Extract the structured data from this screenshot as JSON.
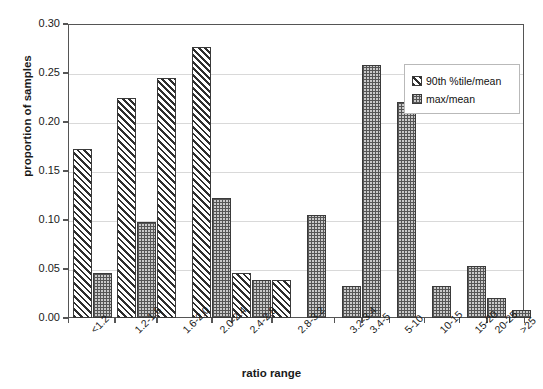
{
  "chart_data": {
    "type": "bar",
    "title": "",
    "xlabel": "ratio range",
    "ylabel": "proportion of samples",
    "ylim": [
      0.0,
      0.3
    ],
    "ytick_labels": [
      "0.00",
      "0.05",
      "0.10",
      "0.15",
      "0.20",
      "0.25",
      "0.30"
    ],
    "ytick_values": [
      0.0,
      0.05,
      0.1,
      0.15,
      0.2,
      0.25,
      0.3
    ],
    "grid": "horizontal",
    "legend_position": "upper-right",
    "categories": [
      "<1.2",
      "1.2-1.6",
      "1.6-2.0",
      "2.0-2.4",
      "2.4-2.8",
      "2.8-3.2",
      "3.2-3.4",
      "3.4-5",
      "5-10",
      "10-15",
      "15-20",
      "20-25",
      ">25"
    ],
    "series": [
      {
        "name": "90th %tile/mean",
        "pattern": "diagonal-hatch",
        "values": [
          0.173,
          0.225,
          0.245,
          0.277,
          0.123,
          0.046,
          0.039,
          0.039,
          0.0,
          0.0,
          0.0,
          0.0,
          0.0
        ]
      },
      {
        "name": "max/mean",
        "pattern": "checkerboard",
        "values": [
          0.046,
          0.098,
          0.0,
          0.0,
          0.0,
          0.0,
          0.105,
          0.033,
          0.258,
          0.22,
          0.033,
          0.053,
          0.02
        ]
      }
    ],
    "bars": [
      {
        "category": "<1.2",
        "series": "90th %tile/mean",
        "value": 0.173
      },
      {
        "category": "<1.2",
        "series": "max/mean",
        "value": 0.046
      },
      {
        "category": "1.2-1.6",
        "series": "90th %tile/mean",
        "value": 0.225
      },
      {
        "category": "1.2-1.6",
        "series": "max/mean",
        "value": 0.098
      },
      {
        "category": "1.2-1.6",
        "series": "90th %tile/mean",
        "value": 0.245
      },
      {
        "category": "1.6-2.0",
        "series": "90th %tile/mean",
        "value": 0.277
      },
      {
        "category": "1.6-2.0",
        "series": "max/mean",
        "value": 0.123
      },
      {
        "category": "2.0-2.4",
        "series": "90th %tile/mean",
        "value": 0.046
      },
      {
        "category": "2.0-2.4",
        "series": "max/mean",
        "value": 0.039
      },
      {
        "category": "2.4-2.8",
        "series": "90th %tile/mean",
        "value": 0.039
      },
      {
        "category": "2.4-2.8",
        "series": "max/mean",
        "value": 0.105
      },
      {
        "category": "3.2-3.4",
        "series": "max/mean",
        "value": 0.033
      },
      {
        "category": "3.4-5",
        "series": "max/mean",
        "value": 0.258
      },
      {
        "category": "5-10",
        "series": "max/mean",
        "value": 0.22
      },
      {
        "category": "10-15",
        "series": "max/mean",
        "value": 0.033
      },
      {
        "category": "15-20",
        "series": "max/mean",
        "value": 0.053
      },
      {
        "category": "20-25",
        "series": "max/mean",
        "value": 0.02
      },
      {
        "category": ">25",
        "series": "max/mean",
        "value": 0.008
      }
    ],
    "colors": {
      "axis": "#555555",
      "grid": "#d9d9d9",
      "bar_outline": "#3a3a3a",
      "hatch": "#2e2e2e",
      "check_fill": "#c9c9c9",
      "text": "#1a1a1a",
      "background": "#ffffff"
    }
  },
  "legend": {
    "entries": [
      {
        "label": "90th %tile/mean"
      },
      {
        "label": "max/mean"
      }
    ]
  }
}
